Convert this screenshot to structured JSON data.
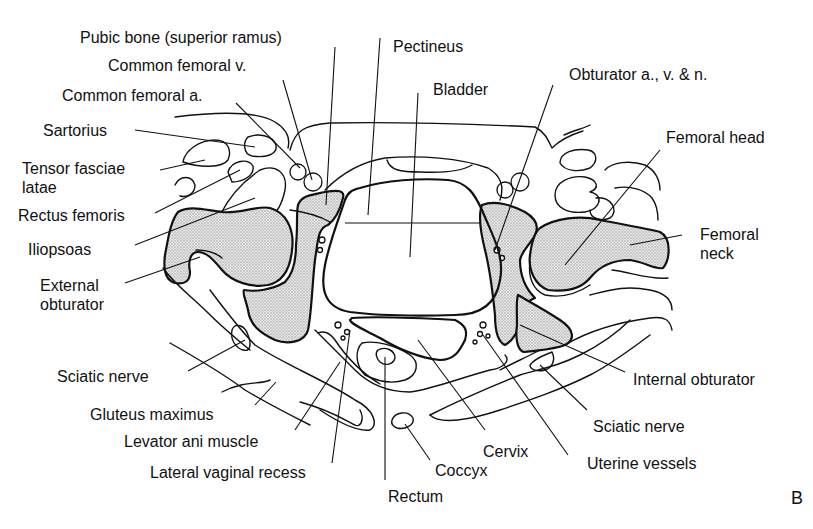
{
  "figure": {
    "panel_letter": "B",
    "bone_fill_color": "#d9d9d9",
    "line_color": "#111111",
    "background": "#ffffff"
  },
  "labels": {
    "left": {
      "pubic_bone": "Pubic bone (superior ramus)",
      "common_femoral_v": "Common femoral v.",
      "common_femoral_a": "Common femoral a.",
      "sartorius": "Sartorius",
      "tensor_fasciae_latae": "Tensor fasciae latae",
      "rectus_femoris": "Rectus femoris",
      "iliopsoas": "Iliopsoas",
      "external_obturator": "External obturator",
      "sciatic_nerve": "Sciatic nerve",
      "gluteus_maximus": "Gluteus maximus",
      "levator_ani": "Levator ani muscle",
      "lateral_vaginal_recess": "Lateral vaginal recess"
    },
    "center": {
      "pectineus": "Pectineus",
      "bladder": "Bladder",
      "rectum": "Rectum",
      "coccyx": "Coccyx",
      "cervix": "Cervix"
    },
    "right": {
      "obturator_avn": "Obturator a., v. & n.",
      "femoral_head": "Femoral head",
      "femoral_neck": "Femoral neck",
      "internal_obturator": "Internal obturator",
      "sciatic_nerve": "Sciatic nerve",
      "uterine_vessels": "Uterine vessels"
    }
  }
}
